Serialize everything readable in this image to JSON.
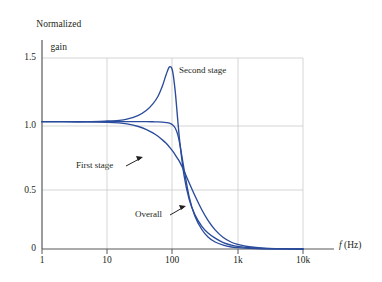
{
  "chart_data": {
    "type": "line",
    "title": "",
    "xlabel": "f (Hz)",
    "ylabel": "Normalized gain",
    "xscale": "log",
    "xlim": [
      1,
      10000
    ],
    "ylim": [
      0,
      1.6
    ],
    "grid": true,
    "legend_position": "inline-annotations",
    "xticks": [
      "1",
      "10",
      "100",
      "1k",
      "10k"
    ],
    "xtick_values": [
      1,
      10,
      100,
      1000,
      10000
    ],
    "yticks": [
      "0",
      "0.5",
      "1.0",
      "1.5"
    ],
    "ytick_values": [
      0,
      0.5,
      1.0,
      1.5
    ],
    "series": [
      {
        "name": "Second stage",
        "color": "#2a4b9b",
        "note": "Peaked second-order response, peak gain 1.43 at about 90 Hz, then rolls off steeply",
        "x": [
          1,
          2,
          5,
          10,
          15,
          20,
          30,
          40,
          50,
          60,
          70,
          80,
          90,
          100,
          110,
          120,
          130,
          150,
          180,
          220,
          280,
          350,
          450,
          600,
          800,
          1000,
          1500,
          2500,
          5000,
          10000
        ],
        "y": [
          1.0,
          1.0,
          1.0,
          1.005,
          1.01,
          1.02,
          1.05,
          1.09,
          1.14,
          1.2,
          1.28,
          1.37,
          1.43,
          1.4,
          1.24,
          1.02,
          0.83,
          0.58,
          0.39,
          0.27,
          0.18,
          0.125,
          0.085,
          0.05,
          0.03,
          0.02,
          0.01,
          0.004,
          0.001,
          0.0
        ]
      },
      {
        "name": "First stage",
        "color": "#2a4b9b",
        "note": "Monotonic first/second-order rolloff, -3 dB near 150 Hz",
        "x": [
          1,
          2,
          5,
          10,
          15,
          20,
          30,
          40,
          50,
          60,
          70,
          80,
          90,
          100,
          110,
          120,
          130,
          150,
          180,
          220,
          280,
          350,
          450,
          600,
          800,
          1000,
          1500,
          2500,
          5000,
          10000
        ],
        "y": [
          1.0,
          1.0,
          0.999,
          0.995,
          0.99,
          0.982,
          0.962,
          0.938,
          0.912,
          0.885,
          0.857,
          0.83,
          0.8,
          0.77,
          0.74,
          0.71,
          0.68,
          0.615,
          0.52,
          0.42,
          0.31,
          0.225,
          0.15,
          0.09,
          0.053,
          0.037,
          0.018,
          0.007,
          0.002,
          0.0
        ]
      },
      {
        "name": "Overall",
        "color": "#2a4b9b",
        "note": "Product of the two stages, maximally flat to about 100 Hz then steep rolloff",
        "x": [
          1,
          2,
          5,
          10,
          15,
          20,
          30,
          40,
          50,
          60,
          70,
          80,
          90,
          100,
          110,
          120,
          130,
          150,
          180,
          220,
          280,
          350,
          450,
          600,
          800,
          1000,
          1500,
          2500,
          5000,
          10000
        ],
        "y": [
          1.0,
          1.0,
          1.0,
          1.0,
          1.0,
          1.0,
          1.0,
          1.0,
          0.999,
          0.998,
          0.996,
          0.993,
          0.988,
          0.975,
          0.95,
          0.9,
          0.82,
          0.63,
          0.41,
          0.26,
          0.155,
          0.095,
          0.055,
          0.03,
          0.016,
          0.011,
          0.005,
          0.002,
          0.0005,
          0.0
        ]
      }
    ],
    "annotations": [
      {
        "text": "Second stage",
        "points_to": "second-stage-curve"
      },
      {
        "text": "First stage",
        "points_to": "first-stage-curve"
      },
      {
        "text": "Overall",
        "points_to": "overall-curve"
      }
    ]
  },
  "labels": {
    "ylabel_line1": "Normalized",
    "ylabel_line2": "gain",
    "xlabel_var": "f",
    "xlabel_unit": "(Hz)",
    "annot_second": "Second stage",
    "annot_first": "First stage",
    "annot_overall": "Overall",
    "ytick_0": "0",
    "ytick_05": "0.5",
    "ytick_10": "1.0",
    "ytick_15": "1.5",
    "xtick_1": "1",
    "xtick_10": "10",
    "xtick_100": "100",
    "xtick_1k": "1k",
    "xtick_10k": "10k"
  },
  "colors": {
    "curve": "#2a4b9b",
    "axis": "#58595b",
    "grid": "#c9cacc",
    "text": "#231f20",
    "background": "#ffffff"
  }
}
